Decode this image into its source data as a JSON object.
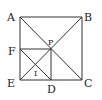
{
  "diagram": {
    "type": "geometry",
    "caption_fragment": "",
    "points": {
      "A": {
        "label": "A",
        "x": 20,
        "y": 17
      },
      "B": {
        "label": "B",
        "x": 82,
        "y": 17
      },
      "C": {
        "label": "C",
        "x": 82,
        "y": 80
      },
      "E": {
        "label": "E",
        "x": 20,
        "y": 80
      },
      "P": {
        "label": "P",
        "x": 51,
        "y": 49
      },
      "F": {
        "label": "F",
        "x": 20,
        "y": 49
      },
      "D": {
        "label": "D",
        "x": 51,
        "y": 80
      },
      "I": {
        "label": "I",
        "x": 36,
        "y": 65
      }
    },
    "segments": [
      "AB",
      "BC",
      "CE",
      "EA",
      "AC",
      "BE",
      "FP",
      "PD",
      "FD"
    ],
    "color": "#333333"
  }
}
